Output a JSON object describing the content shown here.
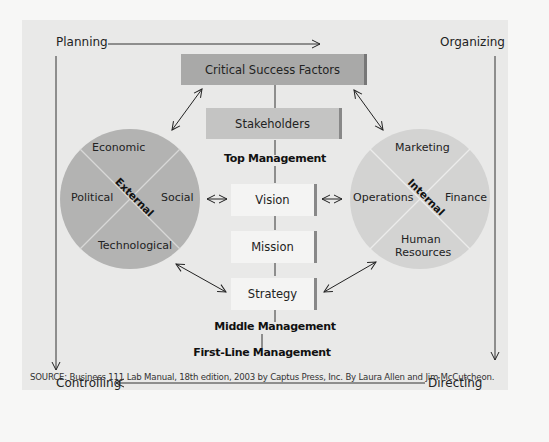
{
  "corners": {
    "top_left": "Planning",
    "top_right": "Organizing",
    "bottom_left": "Controlling",
    "bottom_right": "Directing"
  },
  "center_column": {
    "critical_success_factors": "Critical Success Factors",
    "stakeholders": "Stakeholders",
    "top_management": "Top Management",
    "vision": "Vision",
    "mission": "Mission",
    "strategy": "Strategy",
    "middle_management": "Middle Management",
    "first_line_management": "First-Line Management"
  },
  "external_circle": {
    "center_label": "External",
    "top": "Economic",
    "left": "Political",
    "right": "Social",
    "bottom": "Technological"
  },
  "internal_circle": {
    "center_label": "Internal",
    "top": "Marketing",
    "left": "Operations",
    "right": "Finance",
    "bottom_line1": "Human",
    "bottom_line2": "Resources"
  },
  "colors": {
    "background": "#e9e9e8",
    "dark_box": "#a9a9a8",
    "mid_box": "#c4c4c3",
    "light_box": "#f4f4f3",
    "external_circle": "#b3b3b2",
    "internal_circle": "#d3d3d2"
  },
  "source": "SOURCE: Business 111 Lab Manual, 18th edition, 2003 by Captus Press, Inc. By Laura Allen and Jim McCutcheon."
}
